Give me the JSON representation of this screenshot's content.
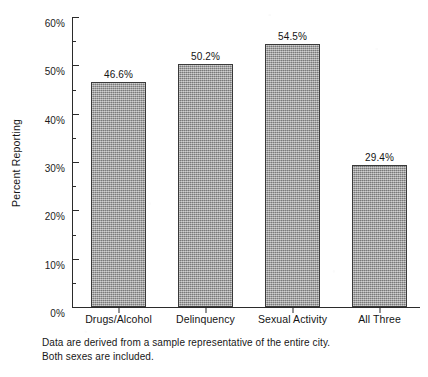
{
  "chart_data": {
    "type": "bar",
    "title": "",
    "xlabel": "",
    "ylabel": "Percent Reporting",
    "categories": [
      "Drugs/Alcohol",
      "Delinquency",
      "Sexual Activity",
      "All Three"
    ],
    "values": [
      46.6,
      50.2,
      54.5,
      29.4
    ],
    "value_labels": [
      "46.6%",
      "50.2%",
      "54.5%",
      "29.4%"
    ],
    "ylim": [
      0,
      60
    ],
    "ytick_values": [
      0,
      10,
      20,
      30,
      40,
      50,
      60
    ],
    "ytick_labels": [
      "0%",
      "10%",
      "20%",
      "30%",
      "40%",
      "50%",
      "60%"
    ],
    "yminor_tick_values": [
      5,
      15,
      25,
      35,
      45,
      55
    ],
    "grid": false,
    "legend": false,
    "bar_color": "#9a9a9a",
    "bar_edge_color": "#3a3a3a",
    "axis_color": "#2b2b2b",
    "background_color": "#ffffff"
  },
  "caption": {
    "line1": "Data are derived from a sample representative of the entire city.",
    "line2": "Both sexes are included."
  }
}
